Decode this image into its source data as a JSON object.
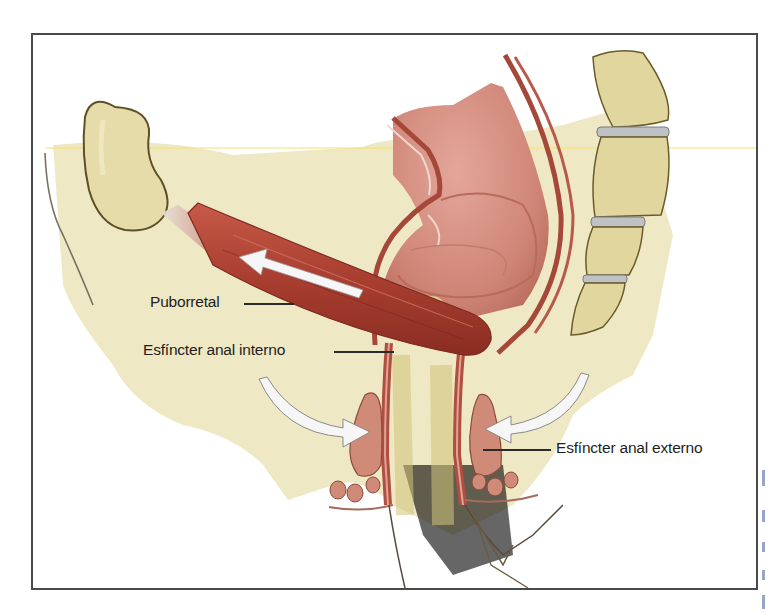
{
  "figure": {
    "type": "anatomical-illustration",
    "colors": {
      "background_tissue": "#efe8c4",
      "bone": "#e3d7a0",
      "bone_outline": "#6b5a2a",
      "disc": "#b9bcc0",
      "muscle": "#b5493a",
      "muscle_dark": "#8e2f24",
      "mucosa": "#d89a8a",
      "arrow_fill": "#ffffff",
      "frame": "#4a4a4a",
      "label_text": "#1e1e1e"
    }
  },
  "labels": {
    "puborretal": "Puborretal",
    "esfinter_interno": "Esfíncter anal interno",
    "esfinter_externo": "Esfíncter anal externo"
  },
  "arrows": [
    {
      "name": "puborectalis-pull-arrow",
      "direction": "up-left"
    },
    {
      "name": "left-compression-arrow",
      "direction": "right"
    },
    {
      "name": "right-compression-arrow",
      "direction": "left"
    }
  ]
}
